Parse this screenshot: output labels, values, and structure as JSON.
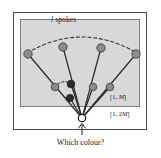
{
  "figure": {
    "title_label": "l spokes",
    "title_italic_part": "l",
    "title_rest": " spokes",
    "caption": "Which colour?",
    "range_inner": "[1, M]",
    "range_outer": "[1, 2M]",
    "colors": {
      "node_light": "#8c8c8c",
      "node_dark": "#2b2b2b",
      "root_fill": "#ffffff",
      "panel_fill": "#d8d8d8",
      "frame_stroke": "#4a4a4a",
      "edge_stroke": "#2b2b2b",
      "arc_stroke": "#333333",
      "background": "#ffffff"
    },
    "outer_frame": {
      "x": 13,
      "y": 12,
      "width": 134,
      "height": 118
    },
    "inner_panel": {
      "x": 20,
      "y": 19,
      "width": 120,
      "height": 88
    },
    "root_node": {
      "x": 82,
      "y": 118,
      "r": 3.6,
      "filled": false
    },
    "arrow": {
      "x": 82,
      "y_from": 134,
      "y_to": 123
    },
    "outer_nodes": [
      {
        "x": 28,
        "y": 54,
        "shade": "light"
      },
      {
        "x": 63,
        "y": 47,
        "shade": "light"
      },
      {
        "x": 101,
        "y": 48,
        "shade": "light"
      },
      {
        "x": 136,
        "y": 54,
        "shade": "light"
      }
    ],
    "inner_nodes": [
      {
        "x": 55,
        "y": 87,
        "shade": "light"
      },
      {
        "x": 71,
        "y": 84,
        "shade": "dark"
      },
      {
        "x": 70,
        "y": 98,
        "shade": "dark"
      },
      {
        "x": 93,
        "y": 87,
        "shade": "light"
      },
      {
        "x": 110,
        "y": 87,
        "shade": "light"
      }
    ],
    "edges": [
      {
        "x1": 82,
        "y1": 118,
        "x2": 28,
        "y2": 54
      },
      {
        "x1": 82,
        "y1": 118,
        "x2": 63,
        "y2": 47
      },
      {
        "x1": 82,
        "y1": 118,
        "x2": 101,
        "y2": 48
      },
      {
        "x1": 82,
        "y1": 118,
        "x2": 136,
        "y2": 54
      },
      {
        "x1": 82,
        "y1": 118,
        "x2": 71,
        "y2": 84
      },
      {
        "x1": 82,
        "y1": 118,
        "x2": 70,
        "y2": 98
      },
      {
        "x1": 82,
        "y1": 118,
        "x2": 93,
        "y2": 87
      },
      {
        "x1": 82,
        "y1": 118,
        "x2": 110,
        "y2": 87
      }
    ],
    "dashed_arc_main": "M 27 53 Q 82 21 137 53",
    "dashed_arc_small": "M 55 87 Q 63 79 71 84"
  }
}
